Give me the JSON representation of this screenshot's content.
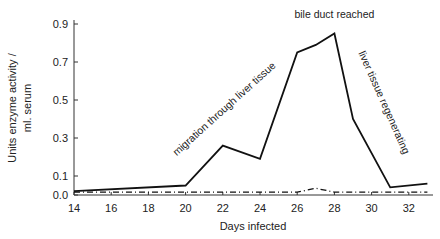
{
  "chart_data": {
    "type": "line",
    "title": "",
    "xlabel": "Days infected",
    "ylabel": "Units enzyme activity / ml. serum",
    "ylabel_lines": [
      "Units  enzyme activity /",
      "ml.  serum"
    ],
    "xlim": [
      14,
      33
    ],
    "ylim": [
      0.0,
      0.9
    ],
    "x_ticks": [
      14,
      16,
      18,
      20,
      22,
      24,
      26,
      28,
      30,
      32
    ],
    "y_ticks": [
      0.0,
      0.1,
      0.3,
      0.5,
      0.7,
      0.9
    ],
    "y_tick_labels": [
      "0.0",
      "0.1",
      "0.3",
      "0.5",
      "0.7",
      "0.9"
    ],
    "grid": false,
    "legend": null,
    "series": [
      {
        "name": "solid",
        "style": "solid",
        "x": [
          14,
          20,
          22,
          24,
          26,
          27,
          28,
          29,
          31,
          33
        ],
        "values": [
          0.02,
          0.05,
          0.26,
          0.19,
          0.75,
          0.79,
          0.85,
          0.4,
          0.04,
          0.06
        ]
      },
      {
        "name": "dashed",
        "style": "dash-dot",
        "x": [
          14,
          20,
          22,
          24,
          26,
          27,
          28,
          30,
          33
        ],
        "values": [
          0.01,
          0.01,
          0.01,
          0.01,
          0.01,
          0.03,
          0.01,
          0.01,
          0.01
        ]
      }
    ],
    "annotations": [
      {
        "text": "migration through liver tissue",
        "x": 22.2,
        "y": 0.44,
        "rotation": -42
      },
      {
        "text": "bile duct reached",
        "x": 28,
        "y": 0.93,
        "rotation": 0
      },
      {
        "text": "liver tissue regenerating",
        "x": 30.5,
        "y": 0.48,
        "rotation": 66
      }
    ]
  }
}
